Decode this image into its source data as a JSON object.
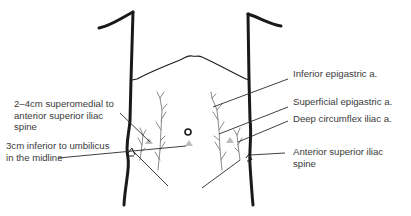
{
  "diagram": {
    "type": "anatomical-illustration",
    "colors": {
      "outline": "#1a1a1a",
      "leader_line": "#2a2a2a",
      "vessel": "#8a8a8a",
      "port_triangle": "#bdbdbd",
      "text": "#3a3a3a"
    },
    "markers": {
      "umbilicus": "circle",
      "port_sites": "grey triangles"
    }
  },
  "labels": {
    "left": [
      {
        "id": "superomedial_asis",
        "lines": [
          "2–4cm superomedial to",
          "anterior superior iliac",
          "spine"
        ]
      },
      {
        "id": "inferior_umbilicus",
        "lines": [
          "3cm inferior to umbilicus",
          "in the midline"
        ]
      }
    ],
    "right": [
      {
        "id": "inferior_epigastric",
        "lines": [
          "Inferior epigastric a."
        ]
      },
      {
        "id": "superficial_epigastric",
        "lines": [
          "Superficial epigastric a."
        ]
      },
      {
        "id": "deep_circumflex",
        "lines": [
          "Deep circumflex iliac a."
        ]
      },
      {
        "id": "asis",
        "lines": [
          "Anterior superior iliac",
          "spine"
        ]
      }
    ]
  }
}
